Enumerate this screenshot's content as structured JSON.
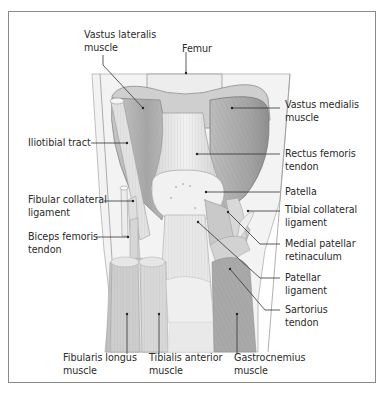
{
  "diagram": {
    "colors": {
      "frame": "#8a8a8a",
      "text": "#2a2a2a",
      "leader_line": "#333333",
      "muscle_dark": "#9a9a9a",
      "muscle_mid": "#bdbdbd",
      "tendon_light": "#e6e6e6",
      "background_limb": "#f0f0f0"
    },
    "labels": {
      "vastus_lateralis": {
        "line1": "Vastus lateralis",
        "line2": "muscle"
      },
      "femur": {
        "line1": "Femur"
      },
      "vastus_medialis": {
        "line1": "Vastus medialis",
        "line2": "muscle"
      },
      "iliotibial_tract": {
        "line1": "Iliotibial tract"
      },
      "rectus_femoris_tendon": {
        "line1": "Rectus femoris",
        "line2": "tendon"
      },
      "fibular_collateral_ligament": {
        "line1": "Fibular collateral",
        "line2": "ligament"
      },
      "patella": {
        "line1": "Patella"
      },
      "tibial_collateral_ligament": {
        "line1": "Tibial collateral",
        "line2": "ligament"
      },
      "biceps_femoris_tendon": {
        "line1": "Biceps femoris",
        "line2": "tendon"
      },
      "medial_patellar_retinaculum": {
        "line1": "Medial patellar",
        "line2": "retinaculum"
      },
      "patellar_ligament": {
        "line1": "Patellar",
        "line2": "ligament"
      },
      "sartorius_tendon": {
        "line1": "Sartorius",
        "line2": "tendon"
      },
      "fibularis_longus": {
        "line1": "Fibularis longus",
        "line2": "muscle"
      },
      "tibialis_anterior": {
        "line1": "Tibialis anterior",
        "line2": "muscle"
      },
      "gastrocnemius": {
        "line1": "Gastrocnemius",
        "line2": "muscle"
      }
    }
  }
}
